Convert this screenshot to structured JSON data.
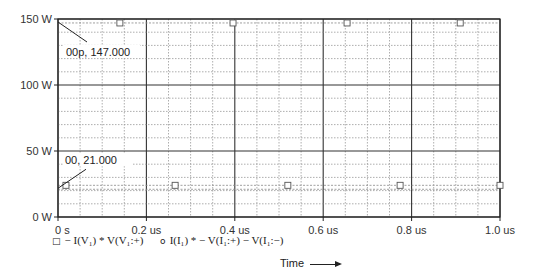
{
  "chart_data": {
    "type": "scatter",
    "title": "",
    "xlabel": "Time",
    "ylabel": "",
    "xlim": [
      0,
      1.0
    ],
    "ylim": [
      0,
      150
    ],
    "x_unit": "us",
    "y_unit": "W",
    "grid": true,
    "x_ticks": [
      "0 s",
      "0.2 us",
      "0.4 us",
      "0.6 us",
      "0.8 us",
      "1.0 us"
    ],
    "y_ticks": [
      "0 W",
      "50 W",
      "100 W",
      "150 W"
    ],
    "series": [
      {
        "name": "- I(V1) * V(V1:+)",
        "marker": "square",
        "x": [
          0.14,
          0.396,
          0.654,
          0.91
        ],
        "y": [
          147,
          147,
          147,
          147
        ]
      },
      {
        "name": "- I(V1) * V(V1:+)",
        "marker": "square",
        "x": [
          0.018,
          0.265,
          0.52,
          0.774,
          1.0
        ],
        "y": [
          24,
          24,
          24,
          24,
          24
        ]
      }
    ],
    "legend": [
      {
        "marker": "square",
        "label": "- I(V1) * V(V1:+)"
      },
      {
        "marker": "circle",
        "label": "I(I1) * - V(I1:+) - V(I1:-)"
      }
    ],
    "annotations": [
      {
        "text": "00p, 147.000",
        "x": 0,
        "y": 147
      },
      {
        "text": "00, 21.000",
        "x": 0,
        "y": 21
      }
    ],
    "legend_position": "bottom-left"
  },
  "labels": {
    "legend_marker_square": "□",
    "legend_marker_circle": "ο",
    "legend_1": "− I(V₁)  *  V(V₁:+)",
    "legend_2": "I(I₁)  * − V(I₁:+) − V(I₁:−)",
    "xlabel": "Time",
    "anno_top": "00p, 147.000",
    "anno_bottom": "00, 21.000"
  }
}
